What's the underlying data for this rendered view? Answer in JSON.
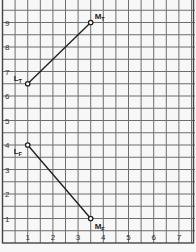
{
  "chart_data": {
    "type": "line",
    "title": "",
    "xlabel": "",
    "ylabel": "",
    "xlim": [
      0,
      7.6
    ],
    "ylim": [
      0,
      9.9
    ],
    "x_ticks": [
      1,
      2,
      3,
      4,
      5,
      6,
      7
    ],
    "y_ticks": [
      1,
      2,
      3,
      4,
      5,
      6,
      7,
      8,
      9
    ],
    "grid": true,
    "grid_step": 0.5,
    "series": [
      {
        "name": "T",
        "points": [
          {
            "label": "L",
            "sub": "T",
            "x": 1,
            "y": 6.5
          },
          {
            "label": "M",
            "sub": "T",
            "x": 3.5,
            "y": 9
          }
        ]
      },
      {
        "name": "F",
        "points": [
          {
            "label": "L",
            "sub": "F",
            "x": 1,
            "y": 4
          },
          {
            "label": "M",
            "sub": "F",
            "x": 3.5,
            "y": 1
          }
        ]
      }
    ]
  },
  "colors": {
    "grid": "#6d6d6d",
    "line": "#222222",
    "background": "#f7f7f7"
  }
}
